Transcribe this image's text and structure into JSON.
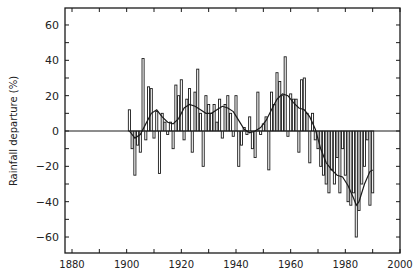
{
  "chart_data": {
    "type": "bar",
    "title": "",
    "xlabel": "",
    "ylabel": "Rainfall departure (%)",
    "xlim": [
      1880,
      2000
    ],
    "ylim": [
      -70,
      70
    ],
    "x_ticks": [
      1880,
      1900,
      1920,
      1940,
      1960,
      1980,
      2000
    ],
    "y_ticks": [
      -60,
      -40,
      -20,
      0,
      20,
      40,
      60
    ],
    "grid": false,
    "legend": null,
    "series": [
      {
        "name": "Annual rainfall departure",
        "type": "bar",
        "x": [
          1901,
          1902,
          1903,
          1904,
          1905,
          1906,
          1907,
          1908,
          1909,
          1910,
          1911,
          1912,
          1913,
          1914,
          1915,
          1916,
          1917,
          1918,
          1919,
          1920,
          1921,
          1922,
          1923,
          1924,
          1925,
          1926,
          1927,
          1928,
          1929,
          1930,
          1931,
          1932,
          1933,
          1934,
          1935,
          1936,
          1937,
          1938,
          1939,
          1940,
          1941,
          1942,
          1943,
          1944,
          1945,
          1946,
          1947,
          1948,
          1949,
          1950,
          1951,
          1952,
          1953,
          1954,
          1955,
          1956,
          1957,
          1958,
          1959,
          1960,
          1961,
          1962,
          1963,
          1964,
          1965,
          1966,
          1967,
          1968,
          1969,
          1970,
          1971,
          1972,
          1973,
          1974,
          1975,
          1976,
          1977,
          1978,
          1979,
          1980,
          1981,
          1982,
          1983,
          1984,
          1985,
          1986,
          1987,
          1988,
          1989,
          1990
        ],
        "values": [
          12,
          -10,
          -25,
          -8,
          -12,
          41,
          -5,
          25,
          24,
          -4,
          11,
          -24,
          10,
          5,
          -2,
          5,
          -10,
          26,
          20,
          29,
          -5,
          18,
          24,
          -12,
          22,
          35,
          10,
          -20,
          20,
          15,
          10,
          15,
          5,
          18,
          -4,
          15,
          20,
          10,
          -3,
          20,
          -20,
          -8,
          2,
          -2,
          8,
          -10,
          -15,
          22,
          -2,
          4,
          8,
          -22,
          22,
          15,
          33,
          28,
          20,
          42,
          -3,
          21,
          18,
          18,
          -12,
          29,
          30,
          10,
          -18,
          10,
          -5,
          -10,
          -20,
          -25,
          -30,
          -35,
          -22,
          -30,
          -15,
          -35,
          -10,
          -25,
          -40,
          -42,
          -35,
          -60,
          -45,
          -30,
          -20,
          -5,
          -42,
          -35
        ]
      },
      {
        "name": "Smoothed trend",
        "type": "line",
        "x": [
          1901,
          1903,
          1905,
          1907,
          1909,
          1911,
          1913,
          1915,
          1917,
          1919,
          1921,
          1923,
          1925,
          1927,
          1929,
          1931,
          1933,
          1935,
          1937,
          1939,
          1941,
          1943,
          1945,
          1947,
          1949,
          1951,
          1953,
          1955,
          1957,
          1959,
          1961,
          1963,
          1965,
          1967,
          1969,
          1971,
          1973,
          1975,
          1977,
          1979,
          1981,
          1983,
          1984,
          1985,
          1987,
          1989,
          1990
        ],
        "values": [
          0,
          -4,
          -2,
          4,
          10,
          12,
          8,
          5,
          4,
          7,
          13,
          15,
          14,
          12,
          10,
          10,
          12,
          14,
          13,
          11,
          6,
          1,
          -1,
          0,
          2,
          6,
          12,
          18,
          21,
          20,
          16,
          13,
          12,
          8,
          1,
          -10,
          -18,
          -22,
          -25,
          -26,
          -31,
          -38,
          -42,
          -40,
          -30,
          -23,
          -22
        ]
      }
    ]
  },
  "axes": {
    "ylabel": "Rainfall departure (%)",
    "x_tick_labels": [
      "1880",
      "1900",
      "1920",
      "1940",
      "1960",
      "1980",
      "2000"
    ],
    "y_tick_labels": [
      "60",
      "40",
      "20",
      "0",
      "−20",
      "−40",
      "−60"
    ]
  },
  "colors": {
    "bar_fill": "#ffffff",
    "bar_stroke": "#1a1a1a",
    "line": "#1a1a1a",
    "axis": "#1a1a1a"
  }
}
